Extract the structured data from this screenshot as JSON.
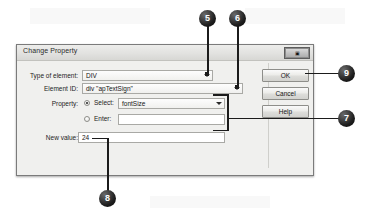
{
  "dialog": {
    "title": "Change Property",
    "window_control": {
      "name": "close-restore-control",
      "glyph": "▣"
    },
    "fields": {
      "type_of_element": {
        "label": "Type of element:",
        "value": "DIV",
        "control": "combobox"
      },
      "element_id": {
        "label": "Element ID:",
        "value": "div \"apTextSign\"",
        "control": "combobox"
      },
      "property": {
        "label": "Property:",
        "select_radio_label": "Select:",
        "select_radio_checked": true,
        "select_value": "fontSize",
        "enter_radio_label": "Enter:",
        "enter_radio_checked": false,
        "enter_value": ""
      },
      "new_value": {
        "label": "New value:",
        "value": "24"
      }
    },
    "buttons": {
      "ok": "OK",
      "cancel": "Cancel",
      "help": "Help"
    }
  },
  "callouts": [
    {
      "id": "5",
      "number": "5",
      "target": "type-of-element-dropdown-arrow"
    },
    {
      "id": "6",
      "number": "6",
      "target": "element-id-dropdown-arrow"
    },
    {
      "id": "7",
      "number": "7",
      "target": "property-select-enter-group"
    },
    {
      "id": "8",
      "number": "8",
      "target": "new-value-field"
    },
    {
      "id": "9",
      "number": "9",
      "target": "ok-button"
    }
  ],
  "colors": {
    "dialog_face": "#f0f0ee",
    "dialog_border": "#7b7b7b",
    "callout_fill": "#1e1e1e",
    "callout_text": "#ffffff",
    "field_background": "#fbfbfb"
  }
}
